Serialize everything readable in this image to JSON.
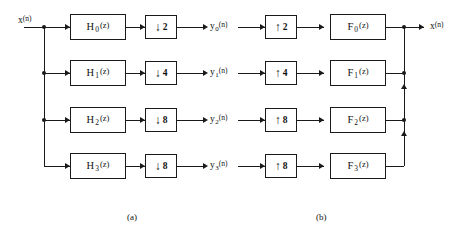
{
  "diagram": {
    "input_label": {
      "base": "x",
      "arg": "(n)"
    },
    "output_label": {
      "base": "x",
      "arg": "(n)"
    },
    "captions": {
      "analysis": "(a)",
      "synthesis": "(b)"
    },
    "channels": [
      {
        "analysis_filter": {
          "base": "H",
          "sub": "0",
          "arg": "(z)"
        },
        "decimator": {
          "arrow": "↓",
          "factor": "2"
        },
        "signal": {
          "base": "y",
          "sub": "0",
          "arg": "(n)"
        },
        "interpolator": {
          "arrow": "↑",
          "factor": "2"
        },
        "synthesis_filter": {
          "base": "F",
          "sub": "0",
          "arg": "(z)"
        }
      },
      {
        "analysis_filter": {
          "base": "H",
          "sub": "1",
          "arg": "(z)"
        },
        "decimator": {
          "arrow": "↓",
          "factor": "4"
        },
        "signal": {
          "base": "y",
          "sub": "1",
          "arg": "(n)"
        },
        "interpolator": {
          "arrow": "↑",
          "factor": "4"
        },
        "synthesis_filter": {
          "base": "F",
          "sub": "1",
          "arg": "(z)"
        }
      },
      {
        "analysis_filter": {
          "base": "H",
          "sub": "2",
          "arg": "(z)"
        },
        "decimator": {
          "arrow": "↓",
          "factor": "8"
        },
        "signal": {
          "base": "y",
          "sub": "2",
          "arg": "(n)"
        },
        "interpolator": {
          "arrow": "↑",
          "factor": "8"
        },
        "synthesis_filter": {
          "base": "F",
          "sub": "2",
          "arg": "(z)"
        }
      },
      {
        "analysis_filter": {
          "base": "H",
          "sub": "3",
          "arg": "(z)"
        },
        "decimator": {
          "arrow": "↓",
          "factor": "8"
        },
        "signal": {
          "base": "y",
          "sub": "3",
          "arg": "(n)"
        },
        "interpolator": {
          "arrow": "↑",
          "factor": "8"
        },
        "synthesis_filter": {
          "base": "F",
          "sub": "3",
          "arg": "(z)"
        }
      }
    ],
    "colors": {
      "ink": "#1a1a1a",
      "background": "#ffffff"
    }
  }
}
